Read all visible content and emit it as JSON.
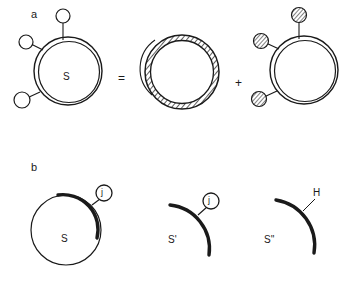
{
  "figure": {
    "background_color": "#ffffff",
    "ink_color": "#1a1a1a",
    "panels": [
      {
        "letter": "a",
        "equation_signs": {
          "equals": "=",
          "plus": "+"
        },
        "terms": [
          {
            "role": "whole-surface",
            "center_label": "S",
            "ring_style": "double-thin",
            "attachments": [
              {
                "fill": "open",
                "position": "top"
              },
              {
                "fill": "open",
                "position": "upper-left"
              },
              {
                "fill": "open",
                "position": "lower-left"
              }
            ]
          },
          {
            "role": "hatched-ring",
            "center_label": "",
            "ring_style": "hatched-annulus",
            "attachments": []
          },
          {
            "role": "decorated-surface",
            "center_label": "",
            "ring_style": "double-thin",
            "attachments": [
              {
                "fill": "hatched",
                "position": "top"
              },
              {
                "fill": "hatched",
                "position": "upper-left"
              },
              {
                "fill": "hatched",
                "position": "lower-left"
              }
            ]
          }
        ]
      },
      {
        "letter": "b",
        "equation_signs": {
          "equals": "",
          "plus": ""
        },
        "terms": [
          {
            "role": "full-circle-with-bold-arc",
            "center_label": "S",
            "ring_style": "thin-circle-bold-arc",
            "attachments": [
              {
                "fill": "open",
                "position": "upper-right",
                "label": "j"
              }
            ]
          },
          {
            "role": "bold-arc-only",
            "center_label": "S'",
            "ring_style": "bold-arc",
            "attachments": [
              {
                "fill": "open",
                "position": "upper-right",
                "label": "j"
              }
            ]
          },
          {
            "role": "bold-arc-with-atom",
            "center_label": "S''",
            "ring_style": "bold-arc",
            "attachments": [
              {
                "fill": "none",
                "position": "upper-right",
                "label": "H"
              }
            ]
          }
        ]
      }
    ]
  }
}
